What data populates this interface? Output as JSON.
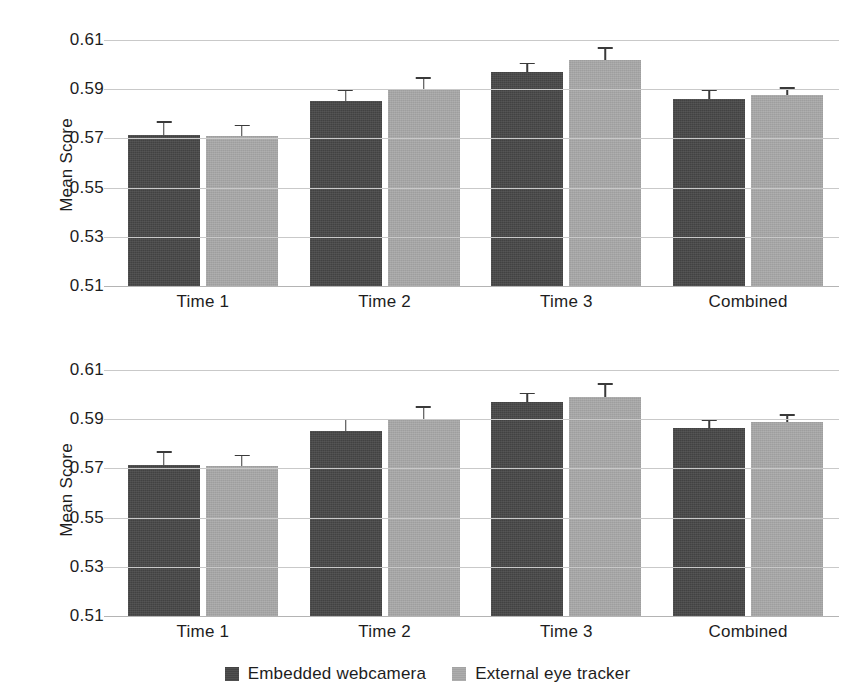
{
  "figure": {
    "background_color": "#ffffff",
    "panel_count": 2
  },
  "legend": {
    "position": "bottom-center",
    "entries": [
      {
        "label": "Embedded webcamera",
        "color": "#474747"
      },
      {
        "label": "External eye tracker",
        "color": "#a9a9a9"
      }
    ]
  },
  "chart_data": [
    {
      "type": "bar",
      "panel": "top",
      "title": "",
      "xlabel": "",
      "ylabel": "Mean Score",
      "ylim": [
        0.51,
        0.61
      ],
      "yticks": [
        0.51,
        0.53,
        0.55,
        0.57,
        0.59,
        0.61
      ],
      "ytick_labels": [
        "0.51",
        "0.53",
        "0.55",
        "0.57",
        "0.59",
        "0.61"
      ],
      "grid": true,
      "legend_position": "bottom-center",
      "categories": [
        "Time 1",
        "Time 2",
        "Time 3",
        "Combined"
      ],
      "series": [
        {
          "name": "Embedded webcamera",
          "color": "#474747",
          "values": [
            0.5715,
            0.5852,
            0.5968,
            0.5862
          ],
          "errors": [
            0.0055,
            0.0048,
            0.004,
            0.0035
          ]
        },
        {
          "name": "External eye tracker",
          "color": "#a9a9a9",
          "values": [
            0.571,
            0.59,
            0.6018,
            0.5878
          ],
          "errors": [
            0.0045,
            0.0048,
            0.0052,
            0.003
          ]
        }
      ]
    },
    {
      "type": "bar",
      "panel": "bottom",
      "title": "",
      "xlabel": "",
      "ylabel": "Mean Score",
      "ylim": [
        0.51,
        0.61
      ],
      "yticks": [
        0.51,
        0.53,
        0.55,
        0.57,
        0.59,
        0.61
      ],
      "ytick_labels": [
        "0.51",
        "0.53",
        "0.55",
        "0.57",
        "0.59",
        "0.61"
      ],
      "grid": true,
      "legend_position": "bottom-center",
      "categories": [
        "Time 1",
        "Time 2",
        "Time 3",
        "Combined"
      ],
      "series": [
        {
          "name": "Embedded webcamera",
          "color": "#474747",
          "values": [
            0.5715,
            0.5852,
            0.5968,
            0.5865
          ],
          "errors": [
            0.0055,
            0.005,
            0.004,
            0.0035
          ]
        },
        {
          "name": "External eye tracker",
          "color": "#a9a9a9",
          "values": [
            0.571,
            0.5902,
            0.5992,
            0.5888
          ],
          "errors": [
            0.0045,
            0.005,
            0.0055,
            0.0032
          ]
        }
      ]
    }
  ]
}
